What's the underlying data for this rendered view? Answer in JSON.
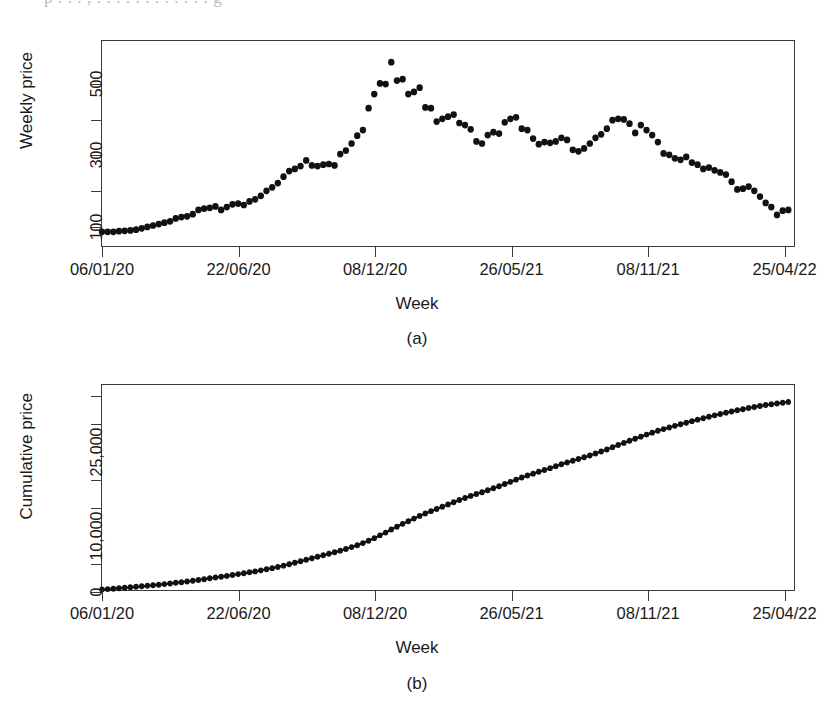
{
  "scan": {
    "top_bleed_text": "p . . . , . . . . . . . . . . . . g"
  },
  "figure": {
    "panels": [
      {
        "caption": "(a)",
        "xlabel": "Week",
        "ylabel": "Weekly price"
      },
      {
        "caption": "(b)",
        "xlabel": "Week",
        "ylabel": "Cumulative price"
      }
    ]
  },
  "chart_data": [
    {
      "type": "scatter",
      "title": "",
      "panel": "(a)",
      "xlabel": "Week",
      "ylabel": "Weekly price",
      "xlim": [
        0,
        122
      ],
      "ylim": [
        40,
        620
      ],
      "grid": false,
      "legend": null,
      "xtick_labels": [
        "06/01/20",
        "22/06/20",
        "08/12/20",
        "26/05/21",
        "08/11/21",
        "25/04/22"
      ],
      "xtick_index": [
        0,
        24,
        48,
        72,
        96,
        120
      ],
      "ytick_labels": [
        "100",
        "",
        "300",
        "",
        "500"
      ],
      "ytick_values": [
        100,
        200,
        300,
        400,
        500
      ],
      "x": [
        0,
        1,
        2,
        3,
        4,
        5,
        6,
        7,
        8,
        9,
        10,
        11,
        12,
        13,
        14,
        15,
        16,
        17,
        18,
        19,
        20,
        21,
        22,
        23,
        24,
        25,
        26,
        27,
        28,
        29,
        30,
        31,
        32,
        33,
        34,
        35,
        36,
        37,
        38,
        39,
        40,
        41,
        42,
        43,
        44,
        45,
        46,
        47,
        48,
        49,
        50,
        51,
        52,
        53,
        54,
        55,
        56,
        57,
        58,
        59,
        60,
        61,
        62,
        63,
        64,
        65,
        66,
        67,
        68,
        69,
        70,
        71,
        72,
        73,
        74,
        75,
        76,
        77,
        78,
        79,
        80,
        81,
        82,
        83,
        84,
        85,
        86,
        87,
        88,
        89,
        90,
        91,
        92,
        93,
        94,
        95,
        96,
        97,
        98,
        99,
        100,
        101,
        102,
        103,
        104,
        105,
        106,
        107,
        108,
        109,
        110,
        111,
        112,
        113,
        114,
        115,
        116,
        117,
        118,
        119,
        120,
        121
      ],
      "values": [
        80,
        80,
        80,
        82,
        83,
        84,
        86,
        90,
        94,
        98,
        102,
        106,
        110,
        118,
        122,
        124,
        130,
        142,
        146,
        148,
        152,
        142,
        150,
        158,
        160,
        156,
        166,
        172,
        182,
        196,
        206,
        218,
        236,
        252,
        258,
        266,
        282,
        268,
        266,
        270,
        272,
        268,
        300,
        310,
        330,
        352,
        368,
        430,
        470,
        500,
        498,
        560,
        508,
        512,
        470,
        476,
        488,
        432,
        430,
        392,
        400,
        406,
        412,
        388,
        382,
        370,
        336,
        330,
        354,
        362,
        358,
        390,
        400,
        404,
        372,
        368,
        344,
        328,
        334,
        332,
        336,
        346,
        340,
        312,
        308,
        316,
        330,
        346,
        356,
        372,
        396,
        400,
        398,
        386,
        360,
        382,
        368,
        354,
        334,
        302,
        298,
        288,
        284,
        292,
        276,
        270,
        258,
        262,
        254,
        248,
        242,
        222,
        200,
        202,
        208,
        196,
        180,
        162,
        150,
        128,
        140,
        142,
        138,
        130,
        122,
        116,
        112,
        108
      ],
      "marker": "filled-circle",
      "color": "#111111"
    },
    {
      "type": "line",
      "panel": "(b)",
      "xlabel": "Week",
      "ylabel": "Cumulative price",
      "xlim": [
        0,
        122
      ],
      "ylim": [
        0,
        37000
      ],
      "grid": false,
      "legend": null,
      "xtick_labels": [
        "06/01/20",
        "22/06/20",
        "08/12/20",
        "26/05/21",
        "08/11/21",
        "25/04/22"
      ],
      "xtick_index": [
        0,
        24,
        48,
        72,
        96,
        120
      ],
      "ytick_labels": [
        "0",
        "",
        "10,000",
        "",
        "",
        "25,000",
        "",
        ""
      ],
      "ytick_values": [
        0,
        5000,
        10000,
        15000,
        20000,
        25000,
        30000,
        35000
      ],
      "x": [
        0,
        1,
        2,
        3,
        4,
        5,
        6,
        7,
        8,
        9,
        10,
        11,
        12,
        13,
        14,
        15,
        16,
        17,
        18,
        19,
        20,
        21,
        22,
        23,
        24,
        25,
        26,
        27,
        28,
        29,
        30,
        31,
        32,
        33,
        34,
        35,
        36,
        37,
        38,
        39,
        40,
        41,
        42,
        43,
        44,
        45,
        46,
        47,
        48,
        49,
        50,
        51,
        52,
        53,
        54,
        55,
        56,
        57,
        58,
        59,
        60,
        61,
        62,
        63,
        64,
        65,
        66,
        67,
        68,
        69,
        70,
        71,
        72,
        73,
        74,
        75,
        76,
        77,
        78,
        79,
        80,
        81,
        82,
        83,
        84,
        85,
        86,
        87,
        88,
        89,
        90,
        91,
        92,
        93,
        94,
        95,
        96,
        97,
        98,
        99,
        100,
        101,
        102,
        103,
        104,
        105,
        106,
        107,
        108,
        109,
        110,
        111,
        112,
        113,
        114,
        115,
        116,
        117,
        118,
        119,
        120,
        121
      ],
      "values": [
        80,
        160,
        240,
        322,
        405,
        489,
        575,
        665,
        759,
        857,
        959,
        1065,
        1175,
        1293,
        1415,
        1539,
        1669,
        1811,
        1957,
        2105,
        2257,
        2399,
        2549,
        2707,
        2867,
        3023,
        3189,
        3361,
        3543,
        3739,
        3945,
        4163,
        4399,
        4651,
        4909,
        5175,
        5457,
        5725,
        5991,
        6261,
        6533,
        6801,
        7101,
        7411,
        7741,
        8093,
        8461,
        8891,
        9361,
        9861,
        10359,
        10919,
        11427,
        11939,
        12409,
        12885,
        13373,
        13805,
        14235,
        14627,
        15027,
        15433,
        15845,
        16233,
        16615,
        16985,
        17321,
        17651,
        18005,
        18367,
        18725,
        19115,
        19515,
        19919,
        20291,
        20659,
        21003,
        21331,
        21665,
        21997,
        22333,
        22679,
        23019,
        23331,
        23639,
        23955,
        24285,
        24631,
        24987,
        25359,
        25755,
        26155,
        26553,
        26939,
        27299,
        27681,
        28049,
        28403,
        28737,
        29039,
        29337,
        29625,
        29909,
        30201,
        30477,
        30747,
        31005,
        31267,
        31521,
        31769,
        32011,
        32233,
        32433,
        32635,
        32843,
        33039,
        33219,
        33381,
        33531,
        33659,
        33799,
        33941,
        34079,
        34209,
        34331,
        34443,
        34551
      ],
      "marker": "filled-circle",
      "color": "#111111"
    }
  ]
}
